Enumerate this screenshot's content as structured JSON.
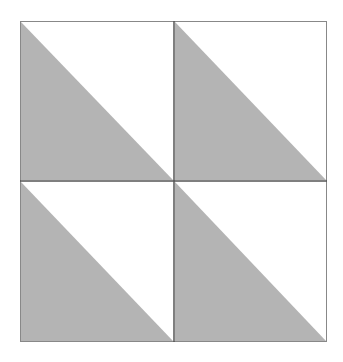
{
  "diagram": {
    "type": "quilt-block-half-square-triangles",
    "grid": {
      "rows": 2,
      "cols": 2
    },
    "colors": {
      "fill": "#b4b4b4",
      "background": "#ffffff",
      "line": "#555555",
      "outer_border": "#777777"
    },
    "bounds": {
      "left": 20,
      "top": 21,
      "right": 327,
      "bottom": 342,
      "mid_x": 174,
      "mid_y": 181
    },
    "cells": [
      {
        "row": 0,
        "col": 0,
        "shaded": "lower-left"
      },
      {
        "row": 0,
        "col": 1,
        "shaded": "lower-left"
      },
      {
        "row": 1,
        "col": 0,
        "shaded": "lower-left"
      },
      {
        "row": 1,
        "col": 1,
        "shaded": "lower-left"
      }
    ]
  }
}
